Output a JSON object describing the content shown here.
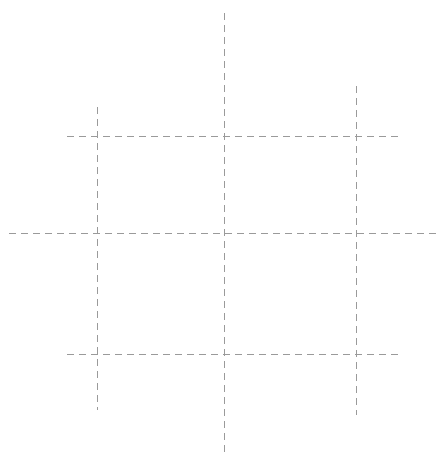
{
  "canvas": {
    "width": 448,
    "height": 461,
    "background": "#ffffff"
  },
  "style": {
    "stroke": "#9a9a9a",
    "stroke_width": 1,
    "dash": "7 5"
  },
  "lines": {
    "vertical": [
      {
        "name": "left-vertical-line",
        "x": 97,
        "y1": 107,
        "y2": 410
      },
      {
        "name": "center-vertical-line",
        "x": 224,
        "y1": 13,
        "y2": 454
      },
      {
        "name": "right-vertical-line",
        "x": 356,
        "y1": 86,
        "y2": 415
      }
    ],
    "horizontal": [
      {
        "name": "top-horizontal-line",
        "y": 136,
        "x1": 67,
        "x2": 398
      },
      {
        "name": "middle-horizontal-line",
        "y": 233,
        "x1": 9,
        "x2": 440
      },
      {
        "name": "bottom-horizontal-line",
        "y": 354,
        "x1": 67,
        "x2": 398
      }
    ]
  }
}
